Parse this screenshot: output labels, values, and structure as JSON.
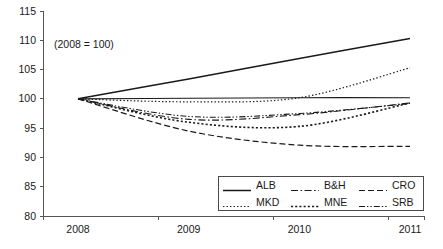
{
  "chart_data": {
    "type": "line",
    "title": "",
    "subtitle": "",
    "annotation": "(2008 = 100)",
    "xlabel": "",
    "ylabel": "",
    "x": [
      "2008",
      "2009",
      "2010",
      "2011"
    ],
    "categories": [
      "2008",
      "2009",
      "2010",
      "2011"
    ],
    "xlim": [
      2008,
      2011
    ],
    "ylim": [
      80,
      115
    ],
    "yticks": [
      80,
      85,
      90,
      95,
      100,
      105,
      110,
      115
    ],
    "xticks": [
      "2008",
      "2009",
      "2010",
      "2011"
    ],
    "grid": false,
    "legend_position": "lower-right",
    "baseline_value": 100,
    "series": [
      {
        "name": "ALB",
        "style": "solid",
        "values": [
          100,
          103.4,
          106.9,
          110.3
        ]
      },
      {
        "name": "B&H",
        "style": "dash-dot",
        "values": [
          100,
          96.5,
          97.3,
          99.3
        ]
      },
      {
        "name": "CRO",
        "style": "dashed",
        "values": [
          100,
          94.5,
          92.1,
          91.9
        ]
      },
      {
        "name": "MKD",
        "style": "dotted-fine",
        "values": [
          100,
          99.5,
          100.2,
          105.3
        ]
      },
      {
        "name": "MNE",
        "style": "dotted-coarse",
        "values": [
          100,
          96.0,
          95.3,
          99.3
        ]
      },
      {
        "name": "SRB",
        "style": "dash-dot-dot",
        "values": [
          100,
          97.0,
          97.5,
          99.2
        ]
      },
      {
        "name": "baseline",
        "style": "solid-thin",
        "values": [
          100,
          100.1,
          100.2,
          100.2
        ]
      }
    ]
  },
  "axis": {
    "y_labels": [
      "115",
      "110",
      "105",
      "100",
      "95",
      "90",
      "85",
      "80"
    ],
    "x_labels": [
      "2008",
      "2009",
      "2010",
      "2011"
    ]
  },
  "legend": {
    "items": [
      {
        "label": "ALB",
        "style": "solid"
      },
      {
        "label": "B&H",
        "style": "dash-dot"
      },
      {
        "label": "CRO",
        "style": "dashed"
      },
      {
        "label": "MKD",
        "style": "dotted-fine"
      },
      {
        "label": "MNE",
        "style": "dotted-coarse"
      },
      {
        "label": "SRB",
        "style": "dash-dot-dot"
      }
    ]
  },
  "colors": {
    "line": "#1a1a1a",
    "axis": "#555555",
    "background": "#ffffff",
    "legend_border": "#4a4a4a"
  }
}
